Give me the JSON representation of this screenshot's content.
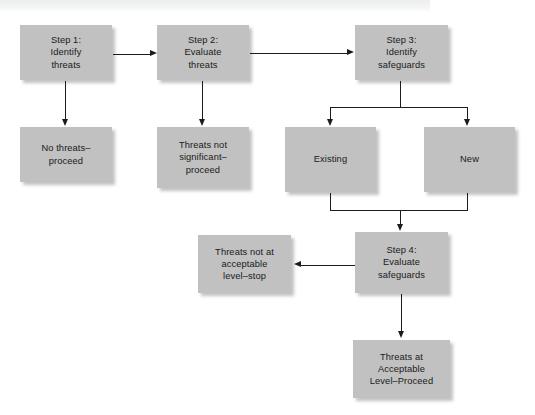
{
  "diagram": {
    "colors": {
      "node_fill": "#c1c1c1",
      "node_text": "#1a1a1a",
      "connector": "#1c1c1c",
      "background": "#ffffff",
      "banner": "#eceded"
    },
    "nodes": [
      {
        "id": "step1",
        "label": "Step 1:\nIdentify\nthreats",
        "x": 20,
        "y": 25,
        "w": 92,
        "h": 55
      },
      {
        "id": "step2",
        "label": "Step 2:\nEvaluate\nthreats",
        "x": 157,
        "y": 25,
        "w": 92,
        "h": 55
      },
      {
        "id": "step3",
        "label": "Step 3:\nIdentify\nsafeguards",
        "x": 355,
        "y": 25,
        "w": 93,
        "h": 55
      },
      {
        "id": "no-threats",
        "label": "No threats–\nproceed",
        "x": 20,
        "y": 127,
        "w": 92,
        "h": 55
      },
      {
        "id": "threats-not-significant",
        "label": "Threats not\nsignificant–\nproceed",
        "x": 157,
        "y": 127,
        "w": 92,
        "h": 61
      },
      {
        "id": "existing",
        "label": "Existing",
        "x": 285,
        "y": 127,
        "w": 91,
        "h": 65
      },
      {
        "id": "new",
        "label": "New",
        "x": 424,
        "y": 127,
        "w": 91,
        "h": 65
      },
      {
        "id": "threats-not-acceptable",
        "label": "Threats not at\nacceptable\nlevel–stop",
        "x": 198,
        "y": 235,
        "w": 93,
        "h": 58
      },
      {
        "id": "step4",
        "label": "Step 4:\nEvaluate\nsafeguards",
        "x": 355,
        "y": 232,
        "w": 93,
        "h": 61
      },
      {
        "id": "threats-acceptable",
        "label": "Threats at\nAcceptable\nLevel–Proceed",
        "x": 353,
        "y": 340,
        "w": 97,
        "h": 58
      }
    ],
    "edges": [
      {
        "id": "step1-to-step2",
        "from": "step1",
        "to": "step2",
        "direction": "right"
      },
      {
        "id": "step2-to-step3",
        "from": "step2",
        "to": "step3",
        "direction": "right"
      },
      {
        "id": "step1-to-no-threats",
        "from": "step1",
        "to": "no-threats",
        "direction": "down"
      },
      {
        "id": "step2-to-threats-not-significant",
        "from": "step2",
        "to": "threats-not-significant",
        "direction": "down"
      },
      {
        "id": "step3-to-existing",
        "from": "step3",
        "to": "existing",
        "direction": "down"
      },
      {
        "id": "step3-to-new",
        "from": "step3",
        "to": "new",
        "direction": "down"
      },
      {
        "id": "existing-to-step4",
        "from": "existing",
        "to": "step4",
        "direction": "down"
      },
      {
        "id": "new-to-step4",
        "from": "new",
        "to": "step4",
        "direction": "down"
      },
      {
        "id": "step4-to-threats-not-acceptable",
        "from": "step4",
        "to": "threats-not-acceptable",
        "direction": "left"
      },
      {
        "id": "step4-to-threats-acceptable",
        "from": "step4",
        "to": "threats-acceptable",
        "direction": "down"
      }
    ]
  }
}
